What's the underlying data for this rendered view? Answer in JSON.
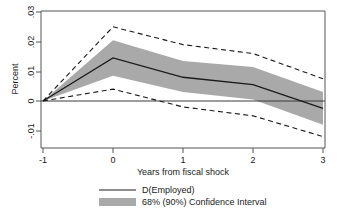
{
  "chart_data": {
    "type": "line",
    "title": "",
    "xlabel": "Years from fiscal shock",
    "ylabel": "Percent",
    "x": [
      -1,
      0,
      1,
      2,
      3
    ],
    "xticks": [
      -1,
      0,
      1,
      2,
      3
    ],
    "xtick_labels": [
      "-1",
      "0",
      "1",
      "2",
      "3"
    ],
    "yticks": [
      -0.01,
      0,
      0.01,
      0.02,
      0.03
    ],
    "ytick_labels": [
      "-.01",
      "0",
      ".01",
      ".02",
      ".03"
    ],
    "xlim": [
      -1.05,
      3.05
    ],
    "ylim": [
      -0.0145,
      0.0325
    ],
    "grid": false,
    "legend_position": "below",
    "series": [
      {
        "name": "D(Employed)",
        "style": "solid",
        "color": "#1a1a1a",
        "values": [
          0.0,
          0.0145,
          0.008,
          0.0055,
          -0.0025
        ]
      },
      {
        "name": "68% Confidence Interval upper",
        "style": "band",
        "color": "#a9a9a9",
        "values": [
          0.0,
          0.0205,
          0.0135,
          0.0115,
          0.003
        ]
      },
      {
        "name": "68% Confidence Interval lower",
        "style": "band",
        "color": "#a9a9a9",
        "values": [
          0.0,
          0.0085,
          0.003,
          0.0005,
          -0.008
        ]
      },
      {
        "name": "90% Confidence Interval upper",
        "style": "dashed",
        "color": "#1a1a1a",
        "values": [
          0.0,
          0.025,
          0.019,
          0.016,
          0.0075
        ]
      },
      {
        "name": "90% Confidence Interval lower",
        "style": "dashed",
        "color": "#1a1a1a",
        "values": [
          0.0,
          0.004,
          -0.002,
          -0.005,
          -0.012
        ]
      }
    ],
    "zero_line": 0
  },
  "axes": {
    "ylabel": "Percent",
    "xlabel": "Years from fiscal shock",
    "ytick_0": ".03",
    "ytick_1": ".02",
    "ytick_2": ".01",
    "ytick_3": "0",
    "ytick_4": "-.01",
    "xtick_0": "-1",
    "xtick_1": "0",
    "xtick_2": "1",
    "xtick_3": "2",
    "xtick_4": "3"
  },
  "legend": {
    "items": [
      {
        "label": "D(Employed)",
        "marker": "line",
        "color": "#1a1a1a"
      },
      {
        "label": "68% (90%) Confidence Interval",
        "marker": "swatch",
        "color": "#a9a9a9"
      }
    ],
    "item_0_label": "D(Employed)",
    "item_1_label": "68% (90%) Confidence Interval"
  },
  "colors": {
    "band": "#a9a9a9",
    "line": "#1a1a1a",
    "frame": "#555555",
    "background": "#ffffff"
  }
}
